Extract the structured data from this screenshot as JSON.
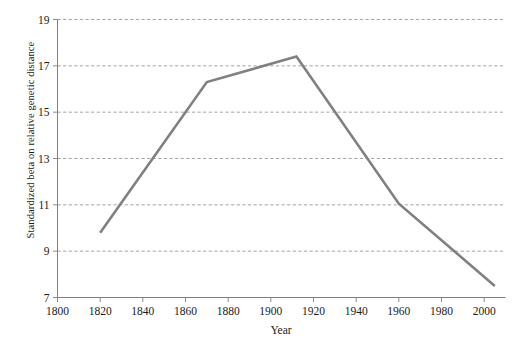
{
  "chart_data": {
    "type": "line",
    "title": "",
    "xlabel": "Year",
    "ylabel": "Standardized beta on relative genetic distance",
    "xlim": [
      1800,
      2010
    ],
    "ylim": [
      7,
      19
    ],
    "xticks": [
      1800,
      1820,
      1840,
      1860,
      1880,
      1900,
      1920,
      1940,
      1960,
      1980,
      2000
    ],
    "yticks": [
      7,
      9,
      11,
      13,
      15,
      17,
      19
    ],
    "xtick_labels": [
      "1800",
      "1820",
      "1840",
      "1860",
      "1880",
      "1900",
      "1920",
      "1940",
      "1960",
      "1980",
      "2000"
    ],
    "ytick_labels": [
      "7",
      "9",
      "11",
      "13",
      "15",
      "17",
      "19"
    ],
    "grid": "horizontal-dashed",
    "legend": "none",
    "series": [
      {
        "name": "Standardized beta on relative genetic distance",
        "color": "#808080",
        "line_width": 2.6,
        "x": [
          1820,
          1870,
          1912,
          1960,
          2005
        ],
        "values": [
          9.8,
          16.3,
          17.4,
          11.05,
          7.5
        ]
      }
    ]
  },
  "axes": {
    "x_title": "Year",
    "y_title": "Standardized beta on relative genetic distance"
  },
  "colors": {
    "line": "#808080",
    "grid": "#999999",
    "axis": "#808080",
    "text": "#1a1a1a",
    "background": "#ffffff"
  }
}
